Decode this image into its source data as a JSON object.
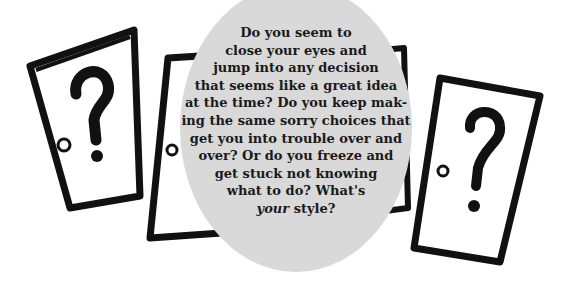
{
  "illustration": {
    "doors": [
      {
        "id": "left",
        "symbol": "?",
        "icon": "question-mark-door"
      },
      {
        "id": "middle",
        "symbol": "",
        "icon": "door-partially-hidden"
      },
      {
        "id": "right",
        "symbol": "?",
        "icon": "question-mark-door"
      }
    ],
    "oval": {
      "color": "#d9d9d9",
      "lines": [
        "Do you seem to",
        "close your eyes and",
        "jump into any decision",
        "that seems like a great idea",
        "at the time? Do you keep mak-",
        "ing the same sorry choices that",
        "get you into trouble over and",
        "over? Or do you freeze and",
        "get stuck not knowing",
        "what to do? What's"
      ],
      "last_line_emphasis": "your",
      "last_line_rest": " style?"
    },
    "colors": {
      "ink": "#111111",
      "oval": "#d9d9d9",
      "background": "#ffffff"
    }
  }
}
